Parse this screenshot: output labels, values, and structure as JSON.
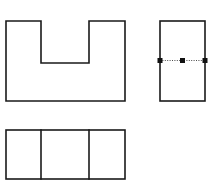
{
  "document": {
    "title": "Orthographic Projection Views",
    "background_color": "#ffffff",
    "line_color": "#1a1a1a",
    "centerline_color": "#4a4a4a",
    "handle_color": "#111111",
    "canvas": {
      "width": 211,
      "height": 193
    }
  },
  "views": {
    "front": {
      "name": "front-view",
      "shape": "notched-rectangle",
      "description": "U-shaped profile with rectangular notch in top edge",
      "outline_points": "6,21 41,21 41,63 89,63 89,21 125,21 125,101 6,101",
      "bounds": {
        "x": 6,
        "y": 21,
        "width": 119,
        "height": 80
      },
      "notch": {
        "x": 41,
        "y": 21,
        "width": 48,
        "depth": 42
      }
    },
    "side": {
      "name": "side-view",
      "shape": "rectangle",
      "description": "Plain rectangle with horizontal centerline selected",
      "bounds": {
        "x": 160,
        "y": 21,
        "width": 45,
        "height": 80
      },
      "centerline": {
        "name": "horizontal-centerline",
        "x1": 160,
        "y1": 60.5,
        "x2": 205,
        "y2": 60.5,
        "style": "dotted",
        "selected": true
      },
      "handles": [
        {
          "name": "handle-left",
          "x": 160,
          "y": 60.5
        },
        {
          "name": "handle-center",
          "x": 182.5,
          "y": 60.5
        },
        {
          "name": "handle-right",
          "x": 205,
          "y": 60.5
        }
      ],
      "handle_size": 5
    },
    "top": {
      "name": "top-view",
      "shape": "divided-rectangle",
      "description": "Rectangle divided into three cells by two vertical lines",
      "bounds": {
        "x": 6,
        "y": 130,
        "width": 119,
        "height": 49
      },
      "dividers": [
        {
          "name": "divider-left",
          "x": 41,
          "y1": 130,
          "y2": 179
        },
        {
          "name": "divider-right",
          "x": 89,
          "y1": 130,
          "y2": 179
        }
      ],
      "cell_count": 3
    }
  }
}
